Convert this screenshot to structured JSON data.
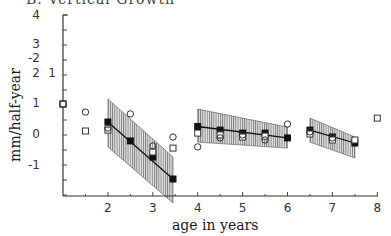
{
  "chart_data": {
    "type": "scatter",
    "title": "B. Vertical Growth",
    "xlabel": "age in years",
    "ylabel": "mm/half-year",
    "xlim": [
      1,
      8
    ],
    "ylim": [
      -2.3,
      4
    ],
    "x_ticks": [
      "2",
      "3",
      "4",
      "5",
      "6",
      "7",
      "8"
    ],
    "y_tick_labels_outer": [
      "4",
      "3",
      "-2",
      "2",
      "1",
      "0",
      "-1"
    ],
    "y_tick_labels_inner": [
      "1"
    ],
    "grid": false,
    "legend": "none",
    "series": [
      {
        "name": "mean (filled squares)",
        "marker": "filled-square",
        "points": [
          [
            1,
            1.0
          ],
          [
            2,
            0.4
          ],
          [
            2.5,
            -0.23
          ],
          [
            3,
            -0.77
          ],
          [
            3.45,
            -1.5
          ],
          [
            4,
            0.25
          ],
          [
            4.5,
            0.13
          ],
          [
            5,
            0.03
          ],
          [
            5.5,
            0.03
          ],
          [
            6,
            -0.13
          ],
          [
            6.5,
            0.13
          ],
          [
            7,
            -0.1
          ],
          [
            7.5,
            -0.3
          ]
        ]
      },
      {
        "name": "open squares",
        "marker": "open-square",
        "points": [
          [
            1,
            1.0
          ],
          [
            1.5,
            0.1
          ],
          [
            2,
            0.13
          ],
          [
            3,
            -0.6
          ],
          [
            3.45,
            -0.47
          ],
          [
            4,
            0.03
          ],
          [
            4.5,
            -0.03
          ],
          [
            5,
            -0.1
          ],
          [
            5.5,
            -0.07
          ],
          [
            6.5,
            0.0
          ],
          [
            7,
            -0.2
          ],
          [
            7.5,
            -0.2
          ],
          [
            8,
            0.53
          ]
        ]
      },
      {
        "name": "open circles",
        "marker": "open-circle",
        "points": [
          [
            1,
            1.0
          ],
          [
            1.5,
            0.73
          ],
          [
            2,
            0.2
          ],
          [
            2.5,
            0.67
          ],
          [
            3,
            -0.4
          ],
          [
            3.45,
            -0.1
          ],
          [
            4,
            -0.43
          ],
          [
            4.5,
            -0.13
          ],
          [
            5,
            -0.03
          ],
          [
            5.5,
            -0.2
          ],
          [
            6,
            0.33
          ],
          [
            6.5,
            0.07
          ],
          [
            7,
            -0.13
          ]
        ]
      }
    ],
    "fit_segments": [
      {
        "x": [
          2,
          3.45
        ],
        "y": [
          0.4,
          -1.5
        ],
        "band_upper": [
          1.17,
          -0.77
        ],
        "band_lower": [
          -0.43,
          -2.3
        ]
      },
      {
        "x": [
          4,
          6
        ],
        "y": [
          0.25,
          -0.13
        ],
        "band_upper": [
          0.83,
          0.23
        ],
        "band_lower": [
          -0.27,
          -0.47
        ]
      },
      {
        "x": [
          6.5,
          7.5
        ],
        "y": [
          0.13,
          -0.3
        ],
        "band_upper": [
          0.53,
          -0.1
        ],
        "band_lower": [
          -0.27,
          -0.8
        ]
      }
    ]
  }
}
